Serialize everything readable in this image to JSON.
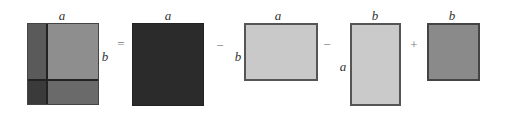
{
  "diagram": {
    "type": "area-decomposition",
    "figures": [
      {
        "id": "full",
        "box": {
          "x": 27,
          "y": 23,
          "w": 72,
          "h": 82
        },
        "split": {
          "x": 47,
          "y": 80
        },
        "regions": {
          "top_left": "#5a5a5a",
          "top_right": "#8e8e8e",
          "bottom_left": "#3a3a3a",
          "bottom_right": "#6a6a6a"
        },
        "divider_color": "#222222",
        "border_color": "#444444",
        "labels": [
          {
            "text": "a",
            "x": 62,
            "y": 15
          },
          {
            "text": "b",
            "x": 105,
            "y": 56
          }
        ]
      },
      {
        "id": "square-a",
        "box": {
          "x": 132,
          "y": 23,
          "w": 72,
          "h": 83
        },
        "fill": "#2b2b2b",
        "border_color": "#222222",
        "labels": [
          {
            "text": "a",
            "x": 168,
            "y": 15
          }
        ]
      },
      {
        "id": "rect-a-by-b",
        "box": {
          "x": 244,
          "y": 23,
          "w": 74,
          "h": 58
        },
        "fill": "#c9c9c9",
        "border_color": "#555555",
        "labels": [
          {
            "text": "a",
            "x": 278,
            "y": 15
          },
          {
            "text": "b",
            "x": 238,
            "y": 56
          }
        ]
      },
      {
        "id": "rect-b-by-a",
        "box": {
          "x": 350,
          "y": 23,
          "w": 51,
          "h": 83
        },
        "fill": "#cacaca",
        "border_color": "#555555",
        "labels": [
          {
            "text": "b",
            "x": 375,
            "y": 15
          },
          {
            "text": "a",
            "x": 343,
            "y": 66
          }
        ]
      },
      {
        "id": "square-b",
        "box": {
          "x": 427,
          "y": 23,
          "w": 53,
          "h": 58
        },
        "fill": "#8a8a8a",
        "border_color": "#444444",
        "labels": [
          {
            "text": "b",
            "x": 452,
            "y": 15
          }
        ]
      }
    ],
    "operators": [
      {
        "symbol": "=",
        "x": 121,
        "y": 43
      },
      {
        "symbol": "−",
        "x": 220,
        "y": 45
      },
      {
        "symbol": "−",
        "x": 327,
        "y": 44
      },
      {
        "symbol": "+",
        "x": 414,
        "y": 44
      }
    ]
  },
  "text": {
    "fig1_top": "a",
    "fig1_right": "b",
    "fig2_top": "a",
    "fig3_top": "a",
    "fig3_left": "b",
    "fig4_top": "b",
    "fig4_left": "a",
    "fig5_top": "b",
    "op_equals": "=",
    "op_minus_1": "−",
    "op_minus_2": "−",
    "op_plus": "+"
  }
}
